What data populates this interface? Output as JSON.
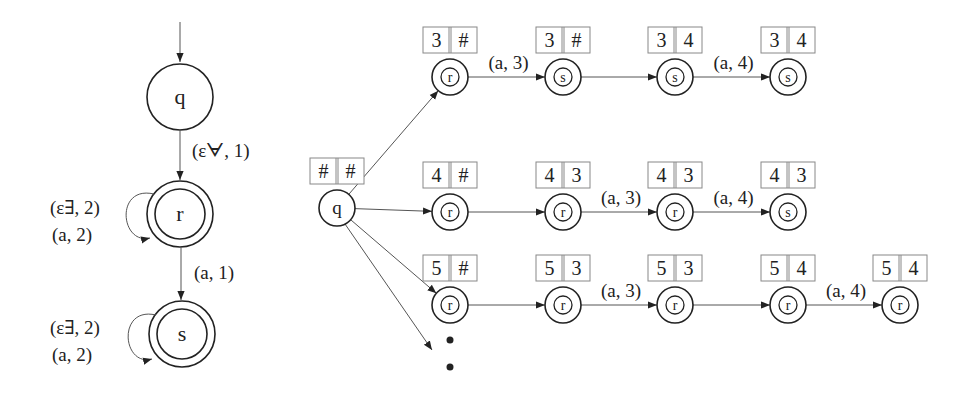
{
  "automaton": {
    "states": [
      {
        "id": "q",
        "label": "q",
        "accepting": false,
        "initial": true,
        "x": 180,
        "y": 97
      },
      {
        "id": "r",
        "label": "r",
        "accepting": true,
        "x": 180,
        "y": 214
      },
      {
        "id": "s",
        "label": "s",
        "accepting": true,
        "x": 182,
        "y": 334
      }
    ],
    "edges": [
      {
        "from": "q",
        "to": "r",
        "label": "(εᗄ, 1)"
      },
      {
        "from": "r",
        "to": "s",
        "label": "(a, 1)"
      }
    ],
    "self_loops": [
      {
        "state": "r",
        "label_top": "(ε∃, 2)",
        "label_bottom": "(a, 2)"
      },
      {
        "state": "s",
        "label_top": "(ε∃, 2)",
        "label_bottom": "(a, 2)"
      }
    ]
  },
  "tree": {
    "root": {
      "label": "q",
      "cells": [
        "#",
        "#"
      ],
      "x": 337,
      "y": 208
    },
    "rows": [
      {
        "y": 77,
        "nodes": [
          {
            "label": "r",
            "cells": [
              "3",
              "#"
            ],
            "x": 450
          },
          {
            "label": "s",
            "cells": [
              "3",
              "#"
            ],
            "x": 563
          },
          {
            "label": "s",
            "cells": [
              "3",
              "4"
            ],
            "x": 675
          },
          {
            "label": "s",
            "cells": [
              "3",
              "4"
            ],
            "x": 788
          }
        ],
        "edge_labels": [
          "(a, 3)",
          "",
          "(a, 4)"
        ]
      },
      {
        "y": 212,
        "nodes": [
          {
            "label": "r",
            "cells": [
              "4",
              "#"
            ],
            "x": 450
          },
          {
            "label": "r",
            "cells": [
              "4",
              "3"
            ],
            "x": 563
          },
          {
            "label": "r",
            "cells": [
              "4",
              "3"
            ],
            "x": 675
          },
          {
            "label": "s",
            "cells": [
              "4",
              "3"
            ],
            "x": 788
          }
        ],
        "edge_labels": [
          "",
          "(a, 3)",
          "(a, 4)"
        ]
      },
      {
        "y": 305,
        "nodes": [
          {
            "label": "r",
            "cells": [
              "5",
              "#"
            ],
            "x": 450
          },
          {
            "label": "r",
            "cells": [
              "5",
              "3"
            ],
            "x": 563
          },
          {
            "label": "r",
            "cells": [
              "5",
              "3"
            ],
            "x": 675
          },
          {
            "label": "r",
            "cells": [
              "5",
              "4"
            ],
            "x": 788
          },
          {
            "label": "r",
            "cells": [
              "5",
              "4"
            ],
            "x": 900
          }
        ],
        "edge_labels": [
          "",
          "(a, 3)",
          "",
          "(a, 4)"
        ]
      }
    ],
    "continuation": "⋮"
  }
}
